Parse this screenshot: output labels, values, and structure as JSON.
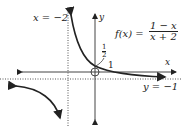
{
  "diagram": {
    "function_label": "f(x) =",
    "numerator": "1 − x",
    "denominator": "x + 2",
    "vertical_asymptote_label": "x = −2",
    "horizontal_asymptote_label": "y = −1",
    "x_axis_label": "x",
    "y_axis_label": "y",
    "y_intercept_num": "1",
    "y_intercept_den": "2",
    "x_intercept_label": "1"
  }
}
